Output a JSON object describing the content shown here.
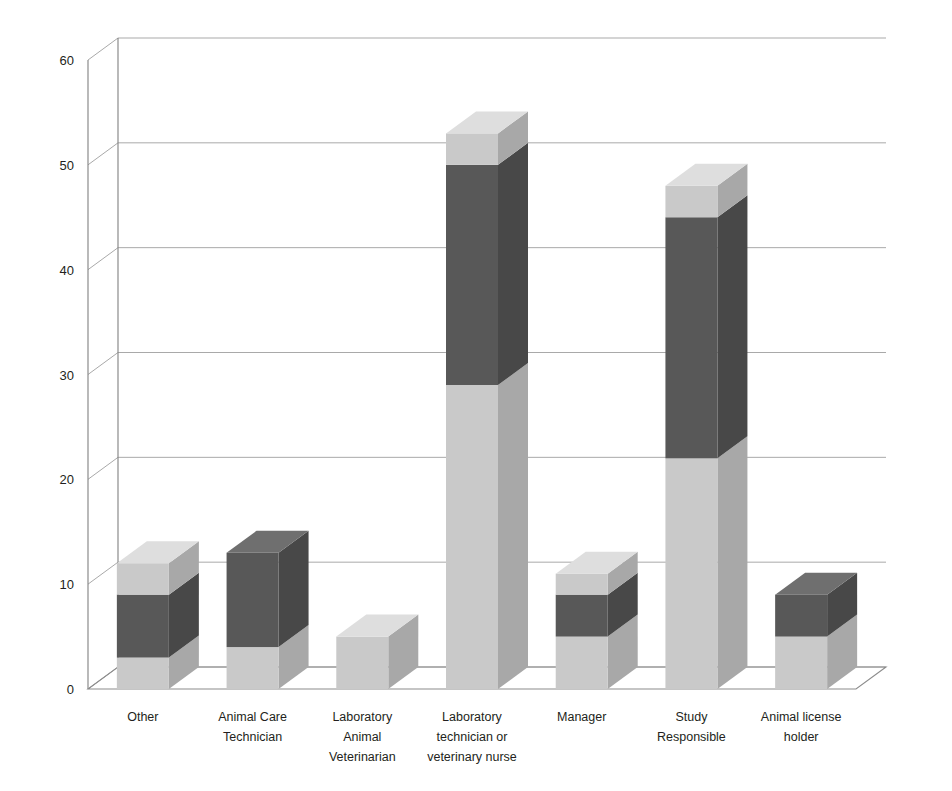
{
  "chart_data": {
    "type": "bar",
    "subtype": "stacked-column-3d",
    "title": "",
    "subtitle": "",
    "xlabel": "",
    "ylabel": "",
    "ylim": [
      0,
      60
    ],
    "yticks": [
      0,
      10,
      20,
      30,
      40,
      50,
      60
    ],
    "ytick_labels": [
      "0",
      "10",
      "20",
      "30",
      "40",
      "50",
      "60"
    ],
    "grid": true,
    "legend": false,
    "legend_position": "none",
    "categories": [
      "Other",
      "Animal Care Technician",
      "Laboratory Animal Veterinarian",
      "Laboratory technician or veterinary nurse",
      "Manager",
      "Study Responsible",
      "Animal license holder"
    ],
    "category_label_lines": [
      [
        "Other"
      ],
      [
        "Animal Care",
        "Technician"
      ],
      [
        "Laboratory",
        "Animal",
        "Veterinarian"
      ],
      [
        "Laboratory",
        "technician or",
        "veterinary nurse"
      ],
      [
        "Manager"
      ],
      [
        "Study",
        "Responsible"
      ],
      [
        "Animal license",
        "holder"
      ]
    ],
    "series": [
      {
        "name": "Series 1",
        "color": "#c9c9c9",
        "values": [
          3,
          4,
          5,
          29,
          5,
          22,
          5
        ]
      },
      {
        "name": "Series 2",
        "color": "#585858",
        "values": [
          6,
          9,
          0,
          21,
          4,
          23,
          4
        ]
      },
      {
        "name": "Series 3",
        "color": "#c9c9c9",
        "values": [
          3,
          0,
          0,
          3,
          2,
          3,
          0
        ]
      }
    ],
    "totals": [
      12,
      13,
      5,
      53,
      11,
      48,
      9
    ],
    "colors": {
      "light_front": "#c9c9c9",
      "light_top": "#dedede",
      "light_side": "#a8a8a8",
      "dark_front": "#585858",
      "dark_top": "#6f6f6f",
      "dark_side": "#484848",
      "gridline": "#a9a9a9",
      "axis": "#808080",
      "text": "#231f20",
      "background": "#ffffff"
    }
  }
}
